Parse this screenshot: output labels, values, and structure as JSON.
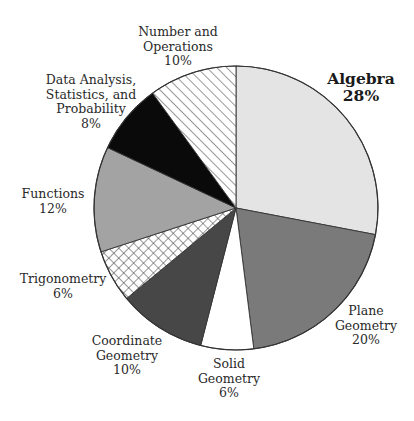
{
  "chart_data": {
    "type": "pie",
    "title": "",
    "start_angle_deg": -90,
    "direction": "clockwise",
    "center": [
      236,
      208
    ],
    "radius": 142,
    "slices": [
      {
        "label": "Algebra",
        "value": 28,
        "pct_label": "28%",
        "fill": "#e4e4e4",
        "pattern": "solid",
        "bold": true,
        "label_lines": [
          "Algebra"
        ],
        "label_pos": [
          361,
          70
        ]
      },
      {
        "label": "Plane Geometry",
        "value": 20,
        "pct_label": "20%",
        "fill": "#7a7a7a",
        "pattern": "solid",
        "bold": false,
        "label_lines": [
          "Plane",
          "Geometry"
        ],
        "label_pos": [
          366,
          304
        ]
      },
      {
        "label": "Solid Geometry",
        "value": 6,
        "pct_label": "6%",
        "fill": "#ffffff",
        "pattern": "solid",
        "bold": false,
        "label_lines": [
          "Solid",
          "Geometry"
        ],
        "label_pos": [
          229,
          357
        ]
      },
      {
        "label": "Coordinate Geometry",
        "value": 10,
        "pct_label": "10%",
        "fill": "#474747",
        "pattern": "solid",
        "bold": false,
        "label_lines": [
          "Coordinate",
          "Geometry"
        ],
        "label_pos": [
          127,
          334
        ]
      },
      {
        "label": "Trigonometry",
        "value": 6,
        "pct_label": "6%",
        "fill": "#ffffff",
        "pattern": "crosshatch",
        "bold": false,
        "label_lines": [
          "Trigonometry"
        ],
        "label_pos": [
          63,
          272
        ]
      },
      {
        "label": "Functions",
        "value": 12,
        "pct_label": "12%",
        "fill": "#a3a3a3",
        "pattern": "solid",
        "bold": false,
        "label_lines": [
          "Functions"
        ],
        "label_pos": [
          53,
          187
        ]
      },
      {
        "label": "Data Analysis, Statistics, and Probability",
        "value": 8,
        "pct_label": "8%",
        "fill": "#0a0a0a",
        "pattern": "solid",
        "bold": false,
        "label_lines": [
          "Data Analysis,",
          "Statistics, and",
          "Probability"
        ],
        "label_pos": [
          91,
          73
        ]
      },
      {
        "label": "Number and Operations",
        "value": 10,
        "pct_label": "10%",
        "fill": "#ffffff",
        "pattern": "diagonal",
        "bold": false,
        "label_lines": [
          "Number and",
          "Operations"
        ],
        "label_pos": [
          178,
          25
        ]
      }
    ],
    "legend": "none",
    "grid": false
  }
}
